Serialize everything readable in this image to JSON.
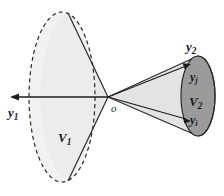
{
  "figure": {
    "background_color": "#ffffff",
    "labels": {
      "y1": {
        "base": "y",
        "subscript": "1",
        "x": 8,
        "y": 106,
        "size": "main"
      },
      "V1": {
        "base": "V",
        "subscript": "1",
        "x": 58,
        "y": 131,
        "size": "main"
      },
      "origin": {
        "base": "o",
        "subscript": "",
        "x": 111,
        "y": 103,
        "size": "origin"
      },
      "y2": {
        "base": "y",
        "subscript": "2",
        "x": 186,
        "y": 40,
        "size": "main"
      },
      "yj": {
        "base": "y",
        "subscript": "j",
        "x": 190,
        "y": 71,
        "size": "sub"
      },
      "V2": {
        "base": "V",
        "subscript": "2",
        "x": 189,
        "y": 95,
        "size": "main"
      },
      "yi": {
        "base": "y",
        "subscript": "i",
        "x": 190,
        "y": 114,
        "size": "sub"
      }
    },
    "colors": {
      "stroke": "#2a2a2a",
      "cone_left_fill": "#e9e9e9",
      "cone_right_fill": "#e0e0e0",
      "ellipse_left_fill": "#ececec",
      "ellipse_right_fill": "#9b9b9b",
      "axis": "#1c1c1c",
      "text": "#1a1a1a"
    },
    "geometry": {
      "apex": {
        "x": 108,
        "y": 97
      },
      "left_ellipse": {
        "cx": 62,
        "cy": 97,
        "rx": 33,
        "ry": 85,
        "dashed": true
      },
      "right_ellipse": {
        "cx": 198,
        "cy": 96,
        "rx": 17,
        "ry": 40,
        "dashed": false
      },
      "axis_arrow": {
        "from_x": 108,
        "from_y": 97,
        "to_x": 11,
        "to_y": 97
      }
    },
    "elements": [
      "left-cone-body",
      "left-cone-base-ellipse",
      "axis-arrow-y1",
      "right-cone-body",
      "right-cone-base-ellipse",
      "vector-arrow-yj",
      "vector-arrow-yi"
    ]
  }
}
